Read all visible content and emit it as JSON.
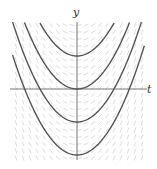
{
  "diagram": {
    "type": "slope_field_with_solution_curves",
    "axes": {
      "x_label": "t",
      "y_label": "y"
    },
    "equation_family": "y = t^2 + C",
    "solution_curves_C": [
      1,
      0,
      -1,
      -2
    ],
    "colors": {
      "curve": "#555555",
      "axis": "#777777",
      "field": "#d4d4d4"
    }
  },
  "chart_data": {
    "type": "line",
    "title": "",
    "xlabel": "t",
    "ylabel": "y",
    "series": [
      {
        "name": "C=1",
        "formula": "t^2+1"
      },
      {
        "name": "C=0",
        "formula": "t^2"
      },
      {
        "name": "C=-1",
        "formula": "t^2-1"
      },
      {
        "name": "C=-2",
        "formula": "t^2-2"
      }
    ],
    "xlim": [
      -1.8,
      1.8
    ],
    "ylim": [
      -2.1,
      2.0
    ],
    "grid": false,
    "slope_field": true
  }
}
